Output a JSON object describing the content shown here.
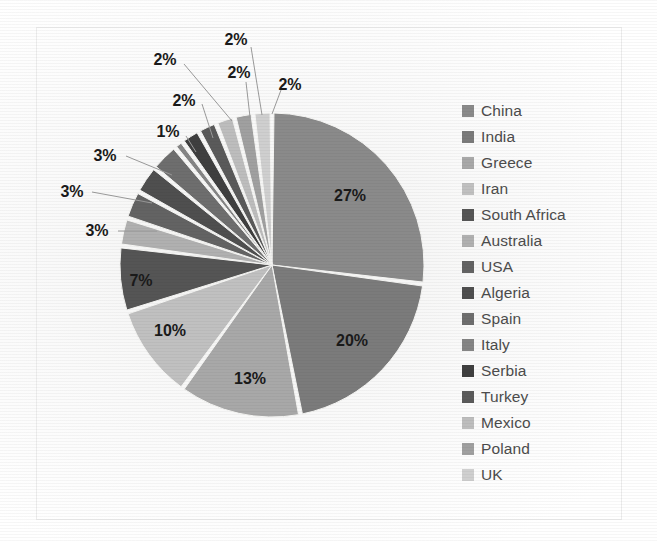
{
  "figure": {
    "background_color": "#fafafa",
    "frame_color": "#ececec",
    "label_color": "#1a1a1a",
    "legend_text_color": "#4c4c4c",
    "leader_line_color": "#9a9a9a",
    "slice_gap_color": "#f5f5f3"
  },
  "chart_data": {
    "type": "pie",
    "title": "",
    "xlabel": "",
    "ylabel": "",
    "grid": false,
    "legend_position": "right",
    "start_angle_deg": 0,
    "direction": "clockwise",
    "value_unit": "%",
    "categories": [
      "China",
      "India",
      "Greece",
      "Iran",
      "South Africa",
      "Australia",
      "USA",
      "Algeria",
      "Spain",
      "Italy",
      "Serbia",
      "Turkey",
      "Mexico",
      "Poland",
      "UK"
    ],
    "values": [
      27,
      20,
      13,
      10,
      7,
      3,
      3,
      3,
      3,
      1,
      2,
      2,
      2,
      2,
      2
    ],
    "labels": [
      "27%",
      "20%",
      "13%",
      "10%",
      "7%",
      "3%",
      "3%",
      "3%",
      "3%",
      "1%",
      "2%",
      "2%",
      "2%",
      "2%",
      "2%"
    ],
    "colors": [
      "#8a8a8a",
      "#7b7b7b",
      "#a8a8a8",
      "#c0c0c0",
      "#555555",
      "#b0b0b0",
      "#636363",
      "#4f4f4f",
      "#6e6e6e",
      "#858585",
      "#3f3f3f",
      "#5a5a5a",
      "#bdbdbd",
      "#a0a0a0",
      "#cfcfcf"
    ]
  },
  "legend": {
    "items": [
      {
        "label": "China",
        "color": "#8a8a8a"
      },
      {
        "label": "India",
        "color": "#7b7b7b"
      },
      {
        "label": "Greece",
        "color": "#a8a8a8"
      },
      {
        "label": "Iran",
        "color": "#c0c0c0"
      },
      {
        "label": "South Africa",
        "color": "#555555"
      },
      {
        "label": "Australia",
        "color": "#b0b0b0"
      },
      {
        "label": "USA",
        "color": "#636363"
      },
      {
        "label": "Algeria",
        "color": "#4f4f4f"
      },
      {
        "label": "Spain",
        "color": "#6e6e6e"
      },
      {
        "label": "Italy",
        "color": "#858585"
      },
      {
        "label": "Serbia",
        "color": "#3f3f3f"
      },
      {
        "label": "Turkey",
        "color": "#5a5a5a"
      },
      {
        "label": "Mexico",
        "color": "#bdbdbd"
      },
      {
        "label": "Poland",
        "color": "#a0a0a0"
      },
      {
        "label": "UK",
        "color": "#cfcfcf"
      }
    ]
  },
  "geometry": {
    "center_x": 272,
    "center_y": 265,
    "radius": 152,
    "explode_gap_deg": 1.5
  },
  "inner_labels": [
    {
      "text": "27%",
      "x": 350,
      "y": 196
    },
    {
      "text": "20%",
      "x": 352,
      "y": 341
    },
    {
      "text": "13%",
      "x": 250,
      "y": 379
    },
    {
      "text": "10%",
      "x": 170,
      "y": 331
    },
    {
      "text": "7%",
      "x": 141,
      "y": 281
    }
  ],
  "callout_labels": [
    {
      "text": "3%",
      "x": 97,
      "y": 231,
      "line": [
        118,
        231,
        157,
        231
      ]
    },
    {
      "text": "3%",
      "x": 72,
      "y": 192,
      "line": [
        92,
        192,
        152,
        203
      ]
    },
    {
      "text": "3%",
      "x": 105,
      "y": 156,
      "line": [
        126,
        156,
        172,
        175
      ]
    },
    {
      "text": "1%",
      "x": 168,
      "y": 132,
      "line": [
        186,
        136,
        196,
        152
      ]
    },
    {
      "text": "2%",
      "x": 184,
      "y": 101,
      "line": [
        202,
        104,
        213,
        138
      ]
    },
    {
      "text": "2%",
      "x": 165,
      "y": 60,
      "line": [
        184,
        64,
        232,
        121
      ]
    },
    {
      "text": "2%",
      "x": 239,
      "y": 73,
      "line": [
        246,
        82,
        250,
        117
      ]
    },
    {
      "text": "2%",
      "x": 236,
      "y": 40,
      "line": [
        251,
        47,
        262,
        115
      ]
    },
    {
      "text": "2%",
      "x": 290,
      "y": 85,
      "line": [
        281,
        90,
        272,
        114
      ]
    }
  ]
}
